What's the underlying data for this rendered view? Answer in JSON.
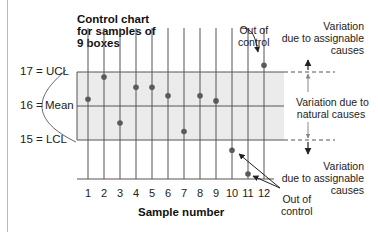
{
  "chart_data": {
    "type": "scatter",
    "title": "Control chart for samples of 9 boxes",
    "title_lines": [
      "Control chart",
      "for samples of",
      "9 boxes"
    ],
    "xlabel": "Sample number",
    "ylabel": "",
    "categories": [
      "1",
      "2",
      "3",
      "4",
      "5",
      "6",
      "7",
      "8",
      "9",
      "10",
      "11",
      "12"
    ],
    "values": [
      16.2,
      16.85,
      15.5,
      16.55,
      16.55,
      16.3,
      15.25,
      16.3,
      16.15,
      14.7,
      14.0,
      17.2
    ],
    "control_limits": {
      "UCL": 17,
      "Mean": 16,
      "LCL": 15
    },
    "y_labels": [
      "17 = UCL",
      "16 = Mean",
      "15 = LCL"
    ],
    "ylim": [
      13.8,
      17.4
    ],
    "grid": "vertical lines at each sample",
    "out_of_control_samples": [
      10,
      11,
      12
    ],
    "annotations": [
      "Out of control",
      "Variation due to assignable causes",
      "Variation due to natural causes",
      "Variation due to assignable causes",
      "Out of control"
    ]
  },
  "labels": {
    "title_1": "Control chart",
    "title_2": "for samples of",
    "title_3": "9 boxes",
    "ucl": "17 = UCL",
    "mean_num": "16 =",
    "mean_word": "Mean",
    "lcl": "15 = LCL",
    "xlabel": "Sample number",
    "out_top_1": "Out of",
    "out_top_2": "control",
    "assign_top_1": "Variation",
    "assign_top_2": "due to assignable",
    "assign_top_3": "causes",
    "natural_1": "Variation due to",
    "natural_2": "natural causes",
    "assign_bot_1": "Variation",
    "assign_bot_2": "due to assignable",
    "assign_bot_3": "causes",
    "out_bot_1": "Out of",
    "out_bot_2": "control"
  },
  "colors": {
    "band": "#ebebeb",
    "line": "#555555",
    "point": "#5a5a5a"
  }
}
